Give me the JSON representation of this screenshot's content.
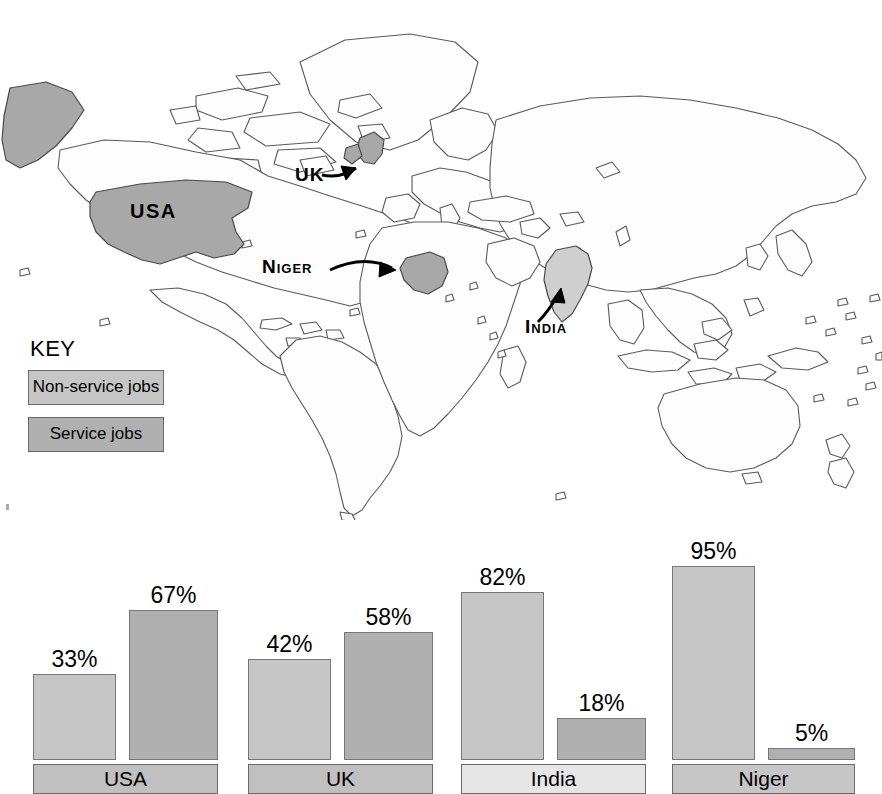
{
  "map": {
    "labels": [
      {
        "id": "usa",
        "text": "USA",
        "style": "plain"
      },
      {
        "id": "uk",
        "text": "UK",
        "style": "plain"
      },
      {
        "id": "niger",
        "text": "Niger",
        "style": "smallcaps"
      },
      {
        "id": "india",
        "text": "India",
        "style": "smallcaps"
      }
    ],
    "highlight_color": "#a8a8a8",
    "india_color": "#cfcfcf",
    "outline_color": "#5a5a5a",
    "ocean_color": "#ffffff"
  },
  "key": {
    "title": "KEY",
    "items": [
      {
        "label": "Non-service jobs",
        "swatch": "#c6c6c6",
        "series": "non_service"
      },
      {
        "label": "Service jobs",
        "swatch": "#b0b0b0",
        "series": "service"
      }
    ]
  },
  "chart_data": {
    "type": "bar",
    "title": "",
    "xlabel": "",
    "ylabel": "",
    "ylim": [
      0,
      100
    ],
    "grid": false,
    "legend_position": "map-key",
    "categories": [
      "USA",
      "UK",
      "India",
      "Niger"
    ],
    "series": [
      {
        "name": "Non-service jobs",
        "color": "#c6c6c6",
        "values": [
          33,
          42,
          82,
          95
        ]
      },
      {
        "name": "Service jobs",
        "color": "#b0b0b0",
        "values": [
          67,
          58,
          18,
          5
        ]
      }
    ],
    "data_labels": [
      [
        "33%",
        "67%"
      ],
      [
        "42%",
        "58%"
      ],
      [
        "82%",
        "18%"
      ],
      [
        "95%",
        "5%"
      ]
    ],
    "category_label_shades": [
      "#c0c0c0",
      "#c0c0c0",
      "#e6e6e6",
      "#c6c6c6"
    ]
  },
  "groups": [
    {
      "name": "USA",
      "left": 33,
      "width": 185,
      "label_shade": "shade-a",
      "bars": [
        {
          "series": "non_service",
          "label": "33%",
          "value": 33,
          "left": 0,
          "width": 83,
          "height": 86
        },
        {
          "series": "service",
          "label": "67%",
          "value": 67,
          "left": 96,
          "width": 89,
          "height": 150
        }
      ]
    },
    {
      "name": "UK",
      "left": 248,
      "width": 185,
      "label_shade": "shade-a",
      "bars": [
        {
          "series": "non_service",
          "label": "42%",
          "value": 42,
          "left": 0,
          "width": 83,
          "height": 101
        },
        {
          "series": "service",
          "label": "58%",
          "value": 58,
          "left": 96,
          "width": 89,
          "height": 128
        }
      ]
    },
    {
      "name": "India",
      "left": 461,
      "width": 185,
      "label_shade": "shade-b",
      "bars": [
        {
          "series": "non_service",
          "label": "82%",
          "value": 82,
          "left": 0,
          "width": 83,
          "height": 168
        },
        {
          "series": "service",
          "label": "18%",
          "value": 18,
          "left": 96,
          "width": 89,
          "height": 42
        }
      ]
    },
    {
      "name": "Niger",
      "left": 672,
      "width": 183,
      "label_shade": "shade-c",
      "bars": [
        {
          "series": "non_service",
          "label": "95%",
          "value": 95,
          "left": 0,
          "width": 83,
          "height": 194
        },
        {
          "series": "service",
          "label": "5%",
          "value": 5,
          "left": 96,
          "width": 87,
          "height": 12
        }
      ]
    }
  ]
}
